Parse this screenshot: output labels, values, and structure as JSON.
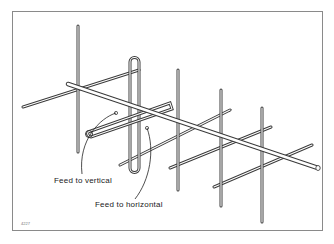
{
  "diagram": {
    "type": "antenna-illustration",
    "labels": {
      "feed_vertical": "Feed to vertical",
      "feed_horizontal": "Feed to horizontal"
    },
    "figure_number": "4227",
    "colors": {
      "rod_outline": "#3a3a3a",
      "rod_fill": "#ffffff",
      "frame": "#8a8a8a",
      "text": "#222222"
    }
  }
}
